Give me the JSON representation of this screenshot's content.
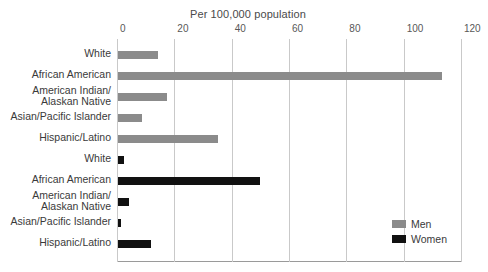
{
  "chart_data": {
    "type": "bar",
    "orientation": "horizontal",
    "title": "Per 100,000 population",
    "xlabel": "",
    "ylabel": "",
    "xlim": [
      0,
      120
    ],
    "xticks": [
      0,
      20,
      40,
      60,
      80,
      100,
      120
    ],
    "grid": true,
    "legend_position": "bottom-right",
    "categories": [
      "White",
      "African American",
      "American Indian/ Alaskan Native",
      "Asian/Pacific Islander",
      "Hispanic/Latino"
    ],
    "series": [
      {
        "name": "Men",
        "color": "#8b8b8b",
        "values": [
          14,
          113,
          17,
          8.5,
          35
        ]
      },
      {
        "name": "Women",
        "color": "#111111",
        "values": [
          2,
          49.5,
          4,
          1.2,
          11.5
        ]
      }
    ],
    "rows": [
      {
        "label_line1": "White",
        "label_line2": "",
        "series": "Men",
        "value": 14
      },
      {
        "label_line1": "African American",
        "label_line2": "",
        "series": "Men",
        "value": 113
      },
      {
        "label_line1": "American Indian/",
        "label_line2": "Alaskan Native",
        "series": "Men",
        "value": 17
      },
      {
        "label_line1": "Asian/Pacific Islander",
        "label_line2": "",
        "series": "Men",
        "value": 8.5
      },
      {
        "label_line1": "Hispanic/Latino",
        "label_line2": "",
        "series": "Men",
        "value": 35
      },
      {
        "label_line1": "White",
        "label_line2": "",
        "series": "Women",
        "value": 2
      },
      {
        "label_line1": "African American",
        "label_line2": "",
        "series": "Women",
        "value": 49.5
      },
      {
        "label_line1": "American Indian/",
        "label_line2": "Alaskan Native",
        "series": "Women",
        "value": 4
      },
      {
        "label_line1": "Asian/Pacific Islander",
        "label_line2": "",
        "series": "Women",
        "value": 1.2
      },
      {
        "label_line1": "Hispanic/Latino",
        "label_line2": "",
        "series": "Women",
        "value": 11.5
      }
    ],
    "legend": [
      {
        "label": "Men",
        "color": "#8b8b8b"
      },
      {
        "label": "Women",
        "color": "#111111"
      }
    ]
  }
}
